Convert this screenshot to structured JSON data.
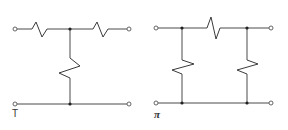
{
  "diagram": {
    "type": "circuit-schematic",
    "networks": [
      {
        "name": "T network",
        "label": "T",
        "series_resistors": 2,
        "shunt_resistors": 1,
        "terminals": 4
      },
      {
        "name": "Pi network",
        "label": "π",
        "series_resistors": 1,
        "shunt_resistors": 2,
        "terminals": 4
      }
    ],
    "colors": {
      "line": "#4a4a4a",
      "background": "#ffffff"
    }
  }
}
